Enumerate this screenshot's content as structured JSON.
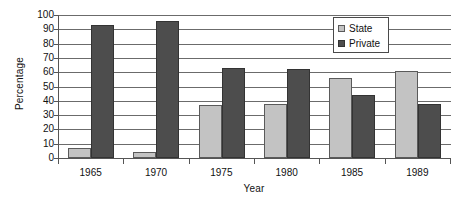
{
  "chart_data": {
    "type": "bar",
    "title": "",
    "xlabel": "Year",
    "ylabel": "Percentage",
    "categories": [
      "1965",
      "1970",
      "1975",
      "1980",
      "1985",
      "1989"
    ],
    "series": [
      {
        "name": "State",
        "color": "#c3c3c3",
        "values": [
          7,
          4,
          37,
          38,
          56,
          61
        ]
      },
      {
        "name": "Private",
        "color": "#4d4d4d",
        "values": [
          93,
          96,
          63,
          62,
          44,
          38
        ]
      }
    ],
    "ylim": [
      0,
      100
    ],
    "y_ticks": [
      0,
      10,
      20,
      30,
      40,
      50,
      60,
      70,
      80,
      90,
      100
    ],
    "y_tick_labels": [
      "0",
      "10",
      "20",
      "30",
      "40",
      "50",
      "60",
      "70",
      "80",
      "90",
      "100"
    ],
    "grid": "horizontal",
    "legend_position": "top-right",
    "legend_entries": [
      "State",
      "Private"
    ]
  }
}
